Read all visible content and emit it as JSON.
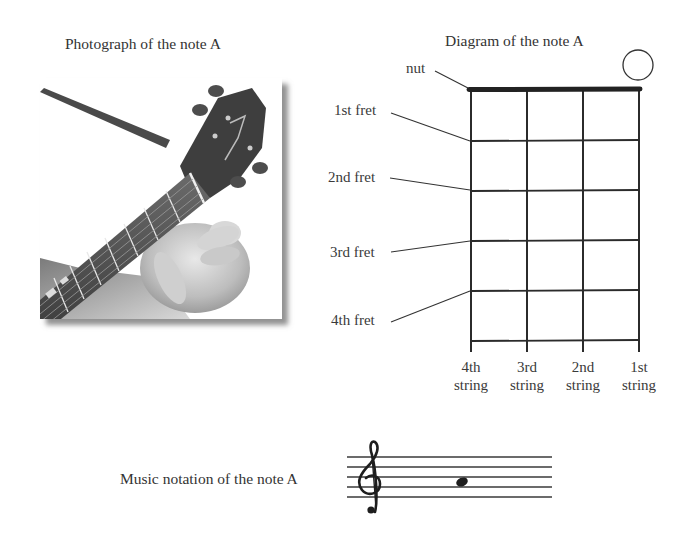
{
  "photo": {
    "caption": "Photograph of the note A",
    "alt": "Hand holding a ukulele neck with open strings, headstock and tuning pegs visible"
  },
  "diagram": {
    "caption": "Diagram of the note A",
    "nut_label": "nut",
    "fret_labels": [
      "1st fret",
      "2nd fret",
      "3rd fret",
      "4th fret"
    ],
    "strings": [
      {
        "line1": "4th",
        "line2": "string"
      },
      {
        "line1": "3rd",
        "line2": "string"
      },
      {
        "line1": "2nd",
        "line2": "string"
      },
      {
        "line1": "1st",
        "line2": "string"
      }
    ],
    "open_string_marker": {
      "string": "1st string",
      "symbol": "open-circle"
    }
  },
  "notation": {
    "caption": "Music notation of the note A",
    "clef": "treble-clef",
    "note": "A",
    "note_position": "second space from top (A4)"
  }
}
